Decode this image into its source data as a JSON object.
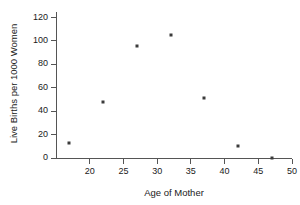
{
  "chart_data": {
    "type": "scatter",
    "title": "",
    "xlabel": "Age of Mother",
    "ylabel": "Live Births per 1000 Women",
    "x": [
      17,
      22,
      27,
      32,
      37,
      42,
      47
    ],
    "y": [
      13,
      48,
      96,
      105,
      51,
      10,
      0
    ],
    "points": [
      {
        "x": 17,
        "y": 13
      },
      {
        "x": 22,
        "y": 48
      },
      {
        "x": 27,
        "y": 96
      },
      {
        "x": 32,
        "y": 105
      },
      {
        "x": 37,
        "y": 51
      },
      {
        "x": 42,
        "y": 10
      },
      {
        "x": 47,
        "y": 0
      }
    ],
    "xlim": [
      15,
      50
    ],
    "ylim": [
      0,
      120
    ],
    "xticks": [
      20,
      25,
      30,
      35,
      40,
      45,
      50
    ],
    "yticks": [
      0,
      20,
      40,
      60,
      80,
      100,
      120
    ],
    "xtick_labels": [
      "20",
      "25",
      "30",
      "35",
      "40",
      "45",
      "50"
    ],
    "ytick_labels": [
      "0",
      "20",
      "40",
      "60",
      "80",
      "100",
      "120"
    ],
    "grid": false,
    "legend": null,
    "marker_color": "#3b3b3b",
    "axis_color": "#555555",
    "background": "#ffffff"
  }
}
